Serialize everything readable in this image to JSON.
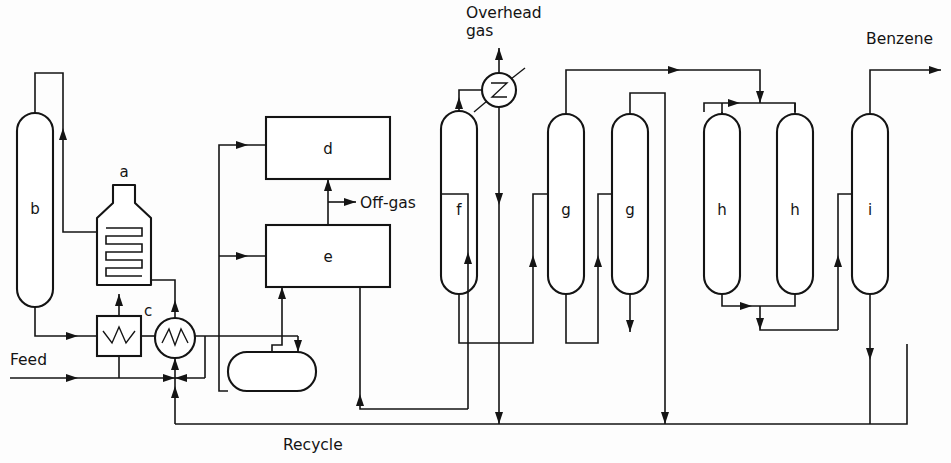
{
  "diagram": {
    "type": "process-flow-diagram",
    "width": 951,
    "height": 463,
    "background_color": "#fdfdfd",
    "line_color": "#141414"
  },
  "stream_labels": {
    "feed": "Feed",
    "recycle": "Recycle",
    "off_gas": "Off-gas",
    "overhead_gas_line1": "Overhead",
    "overhead_gas_line2": "gas",
    "benzene": "Benzene"
  },
  "equipment": [
    {
      "id": "a",
      "label": "a",
      "kind": "fired-heater",
      "x": 124,
      "y": 232
    },
    {
      "id": "b",
      "label": "b",
      "kind": "column",
      "x": 35,
      "y": 208
    },
    {
      "id": "c",
      "label": "c",
      "kind": "heat-exchanger-box",
      "x": 119,
      "y": 318
    },
    {
      "id": "d",
      "label": "d",
      "kind": "rectangular-unit",
      "x": 328,
      "y": 152
    },
    {
      "id": "e",
      "label": "e",
      "kind": "rectangular-unit",
      "x": 328,
      "y": 255
    },
    {
      "id": "f",
      "label": "f",
      "kind": "column",
      "x": 459,
      "y": 210
    },
    {
      "id": "g1",
      "label": "g",
      "kind": "column",
      "x": 566,
      "y": 210
    },
    {
      "id": "g2",
      "label": "g",
      "kind": "column",
      "x": 630,
      "y": 210
    },
    {
      "id": "h1",
      "label": "h",
      "kind": "column",
      "x": 722,
      "y": 210
    },
    {
      "id": "h2",
      "label": "h",
      "kind": "column",
      "x": 795,
      "y": 210
    },
    {
      "id": "i",
      "label": "i",
      "kind": "column",
      "x": 870,
      "y": 210
    }
  ],
  "unlabeled_equipment": [
    {
      "kind": "shell-and-tube-exchanger-round",
      "x": 175,
      "y": 338
    },
    {
      "kind": "overhead-condenser-round",
      "x": 499,
      "y": 90
    },
    {
      "kind": "horizontal-drum",
      "x": 272,
      "y": 371
    }
  ]
}
